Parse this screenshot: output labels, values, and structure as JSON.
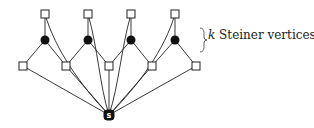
{
  "diagram": {
    "annotation": {
      "variable": "k",
      "text": "Steiner vertices"
    },
    "source_node": {
      "label": "s",
      "x": 109,
      "y": 115
    },
    "top_terminals": [
      {
        "x": 45,
        "y": 14
      },
      {
        "x": 88,
        "y": 14
      },
      {
        "x": 131,
        "y": 14
      },
      {
        "x": 175,
        "y": 14
      }
    ],
    "steiner_vertices": [
      {
        "x": 45,
        "y": 40
      },
      {
        "x": 88,
        "y": 40
      },
      {
        "x": 131,
        "y": 40
      },
      {
        "x": 175,
        "y": 40
      }
    ],
    "bottom_terminals": [
      {
        "x": 23,
        "y": 66
      },
      {
        "x": 66,
        "y": 66
      },
      {
        "x": 109,
        "y": 66
      },
      {
        "x": 152,
        "y": 66
      },
      {
        "x": 196,
        "y": 66
      }
    ],
    "colors": {
      "stroke": "#222222",
      "fill_steiner": "#111111",
      "terminal_fill": "#ffffff"
    }
  }
}
